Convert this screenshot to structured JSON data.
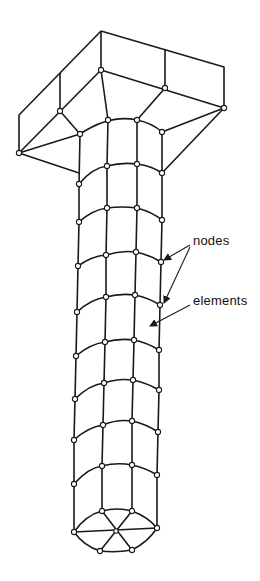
{
  "figure": {
    "colors": {
      "line": "#1a1a1a",
      "background": "#ffffff",
      "node_fill": "#ffffff"
    }
  },
  "annotations": {
    "nodes_label": "nodes",
    "elements_label": "elements"
  },
  "mesh": {
    "head_outline": [
      [
        101,
        31
      ],
      [
        224,
        67
      ],
      [
        224,
        108
      ],
      [
        101,
        70
      ]
    ],
    "shaft_columns_x_top": [
      79,
      108,
      137,
      162
    ],
    "shaft_rows": 10
  }
}
